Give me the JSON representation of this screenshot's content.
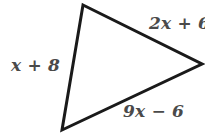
{
  "figure": {
    "type": "triangle-diagram",
    "background_color": "#ffffff",
    "stroke_color": "#1a1a1a",
    "stroke_width": 3,
    "label_color": "#4a4a4a",
    "vertices": {
      "top": {
        "x": 83,
        "y": 5
      },
      "right": {
        "x": 202,
        "y": 64
      },
      "bottom_left": {
        "x": 62,
        "y": 130
      }
    },
    "labels": {
      "left_side": "x + 8",
      "top_right_side": "2x + 6",
      "bottom_side": "9x − 6"
    }
  }
}
